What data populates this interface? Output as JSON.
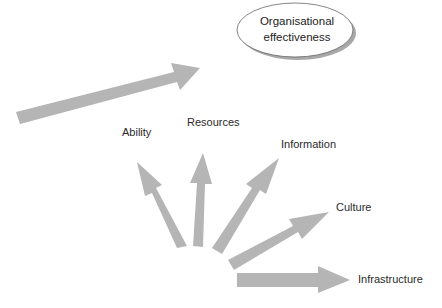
{
  "diagram": {
    "target": {
      "line1": "Organisational",
      "line2": "effectiveness"
    },
    "factors": [
      {
        "label": "Ability"
      },
      {
        "label": "Resources"
      },
      {
        "label": "Information"
      },
      {
        "label": "Culture"
      },
      {
        "label": "Infrastructure"
      }
    ],
    "colors": {
      "arrow": "#b5b5b5",
      "ellipse_fill": "#ffffff",
      "ellipse_stroke": "#555555",
      "shadow": "#9a9a9a"
    }
  }
}
